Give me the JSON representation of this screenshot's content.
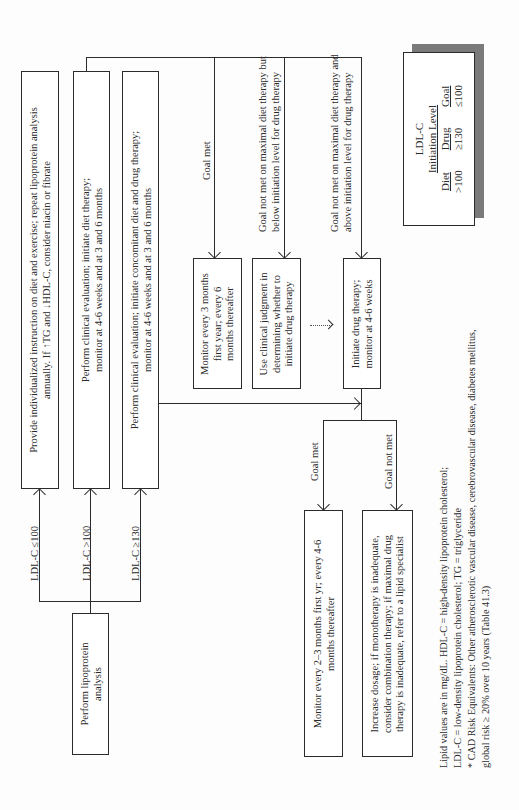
{
  "flowchart": {
    "start": "Perform lipoprotein\nanalysis",
    "branches": [
      {
        "condition": "LDL-C ≤100",
        "action": "Provide individualized instruction on diet and exercise; repeat lipoprotein analysis\nannually. If ↑TG and ↓HDL-C, consider niacin or fibrate"
      },
      {
        "condition": "LDL-C >100",
        "action": "Perform clinical evaluation; initiate diet therapy;\nmonitor at 4-6 weeks and at 3 and 6 months"
      },
      {
        "condition": "LDL-C ≥130",
        "action": "Perform clinical evaluation; initiate concomitant diet and drug therapy;\nmonitor at 4-6 weeks and at 3 and 6 months"
      }
    ],
    "diet_outcomes": [
      {
        "condition": "Goal met",
        "action": "Monitor every 3 months\nfirst year; every 6\nmonths thereafter"
      },
      {
        "condition": "Goal not met on maximal diet therapy but\nbelow initiation level for drug therapy",
        "action": "Use clinical judgment in\ndetermining whether to\ninitiate drug therapy"
      },
      {
        "condition": "Goal not met on maximal diet therapy and\nabove initiation level for drug therapy",
        "action": "Initiate drug therapy;\nmonitor at 4-6 weeks"
      }
    ],
    "drug_outcomes": [
      {
        "condition": "Goal met",
        "action": "Monitor every 2–3 months first yr; every 4-6\nmonths thereafter"
      },
      {
        "condition": "Goal not met",
        "action": "Increase dosage; if monotherapy is inadequate,\nconsider combination therapy; if maximal drug\ntherapy is inadequate, refer to a lipid specialist"
      }
    ]
  },
  "legend": {
    "title": "LDL-C",
    "subtitle": "Initiation Level",
    "columns": [
      {
        "header": "Diet",
        "value": ">100"
      },
      {
        "header": "Drug",
        "value": "≥130"
      },
      {
        "header": "Goal",
        "value": "≤100"
      }
    ]
  },
  "footnotes": [
    "Lipid values are in mg/dL. HDL-C = high-density lipoprotein cholesterol;",
    "LDL-C = low-density lipoprotein cholesterol;  TG = triglyceride",
    "* CAD Risk Equivalents:  Other atherosclerotic vascular disease, cerebrovascular disease, diabetes mellitus,",
    "global risk ≥ 20% over 10 years (Table 41.3)"
  ]
}
